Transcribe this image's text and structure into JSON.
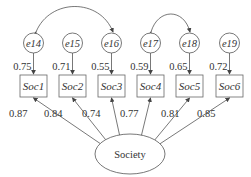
{
  "diagram": {
    "type": "sem-measurement-model",
    "latent": {
      "label": "Society",
      "cx": 130,
      "cy": 154,
      "rx": 35,
      "ry": 20
    },
    "indicators": [
      {
        "label": "Soc1",
        "x": 20,
        "loading": "0.87",
        "error": "e14",
        "error_var": "0.75"
      },
      {
        "label": "Soc2",
        "x": 59,
        "loading": "0.84",
        "error": "e15",
        "error_var": "0.71"
      },
      {
        "label": "Soc3",
        "x": 98,
        "loading": "0.74",
        "error": "e16",
        "error_var": "0.55"
      },
      {
        "label": "Soc4",
        "x": 137,
        "loading": "0.77",
        "error": "e17",
        "error_var": "0.59"
      },
      {
        "label": "Soc5",
        "x": 176,
        "loading": "0.81",
        "error": "e18",
        "error_var": "0.65"
      },
      {
        "label": "Soc6",
        "x": 216,
        "loading": "0.85",
        "error": "e19",
        "error_var": "0.72"
      }
    ],
    "covariances": [
      {
        "from": "e14",
        "to": "e16"
      },
      {
        "from": "e17",
        "to": "e18"
      }
    ],
    "colors": {
      "line": "#555555",
      "text": "#333333",
      "background": "#ffffff"
    }
  }
}
